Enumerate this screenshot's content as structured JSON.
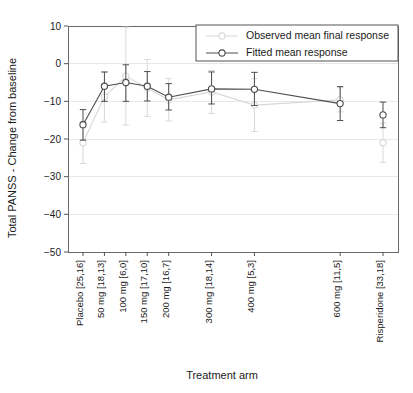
{
  "chart_data": {
    "type": "line",
    "title": "",
    "xlabel": "Treatment arm",
    "ylabel": "Total PANSS - Change from baseline",
    "ylim": [
      -50,
      10
    ],
    "y_ticks": [
      10,
      0,
      -10,
      -20,
      -30,
      -40,
      -50
    ],
    "y_tick_labels": [
      "10",
      "0",
      "−10",
      "−20",
      "−30",
      "−40",
      "−50"
    ],
    "grid": "horizontal",
    "legend_position": "top-right",
    "categories": [
      "Placebo [25,16]",
      "50 mg [18,13]",
      "100 mg [6,0]",
      "150 mg [17,10]",
      "200 mg [16,7]",
      "300 mg [18,14]",
      "400 mg [5,3]",
      "600 mg [11,5]",
      "Risperidone [33,18]"
    ],
    "x_positions": [
      0,
      50,
      100,
      150,
      200,
      300,
      400,
      600,
      700
    ],
    "xlim": [
      -35,
      735
    ],
    "series": [
      {
        "name": "Fitted mean response",
        "color": "#4d4d4d",
        "marker": "circle-open",
        "connected_indices": [
          0,
          1,
          2,
          3,
          4,
          5,
          6,
          7
        ],
        "values": [
          -16.2,
          -6.0,
          -5.0,
          -6.0,
          -8.9,
          -6.7,
          -6.8,
          -10.6,
          -13.6
        ],
        "err_low": [
          -20.3,
          -10.0,
          -10.0,
          -9.9,
          -12.3,
          -10.7,
          -11.1,
          -15.1,
          -17.0
        ],
        "err_high": [
          -12.2,
          -2.2,
          -0.3,
          -2.1,
          -5.3,
          -2.2,
          -2.3,
          -6.1,
          -10.2
        ]
      },
      {
        "name": "Observed mean final response",
        "color": "#d8d8d8",
        "marker": "circle-open",
        "connected_indices": [
          0,
          1,
          2,
          3,
          4,
          5,
          6,
          7
        ],
        "values": [
          -21.0,
          -8.8,
          -3.3,
          -6.5,
          -9.6,
          -7.5,
          -11.0,
          -9.6,
          -21.0
        ],
        "err_low": [
          -26.5,
          -15.5,
          -16.3,
          -14.0,
          -15.2,
          -13.2,
          -18.0,
          -12.8,
          -26.2
        ],
        "err_high": [
          -15.3,
          -2.3,
          9.7,
          1.1,
          -4.0,
          -1.8,
          -4.0,
          -6.4,
          -15.8
        ]
      }
    ],
    "legend": [
      {
        "label": "Observed mean final response",
        "color": "#d8d8d8",
        "marker": "circle-open"
      },
      {
        "label": "Fitted mean response",
        "color": "#4d4d4d",
        "marker": "circle-open"
      }
    ]
  }
}
